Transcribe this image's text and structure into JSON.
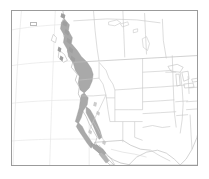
{
  "figure": {
    "type": "range-map",
    "region": "North America — western United States, southwestern Canada, northern Mexico",
    "title": "",
    "caption": "",
    "frame": {
      "border_color": "#9b9b9b",
      "background_color": "#ffffff",
      "x": 11,
      "y": 10,
      "width": 187,
      "height": 156
    }
  },
  "map": {
    "projection_hint": "conic, curved graticule",
    "graticule": {
      "visible": true,
      "color": "#e4e4e4",
      "meridian_count": 6,
      "parallel_count": 4
    },
    "layers": [
      {
        "name": "coastline",
        "label": "Coastline /国 national outlines",
        "stroke": "#b0b0b0",
        "fill": "#ffffff"
      },
      {
        "name": "political-boundaries",
        "label": "State and provincial boundaries",
        "stroke": "#c2c2c2",
        "fill": "none"
      },
      {
        "name": "distribution-range",
        "label": "Shaded distribution range",
        "fill": "#a9a9a9",
        "stroke": "#8f8f8f",
        "extent_description": "Pacific coastal belt from the Alaska panhandle and coastal British Columbia south through Washington, Oregon, and California, including the Sierra Nevada and northern Baja California"
      }
    ],
    "features": {
      "great_lakes": "visible at right edge",
      "gulf_of_mexico": "visible at lower right",
      "baja_california": "visible at lower left-center",
      "hudson_bay_lakes": "small lakes visible in central Canada"
    },
    "inset_marker": {
      "visible": true,
      "description": "small outlined box near upper-left of frame"
    }
  },
  "colors": {
    "range_gray": "#a9a9a9",
    "boundary_gray": "#c2c2c2",
    "coast_gray": "#b0b0b0",
    "graticule_gray": "#e4e4e4",
    "frame_gray": "#9b9b9b",
    "background_white": "#ffffff"
  },
  "legend": {
    "visible": false,
    "entries": []
  },
  "labels": {
    "visible": false,
    "items": []
  }
}
